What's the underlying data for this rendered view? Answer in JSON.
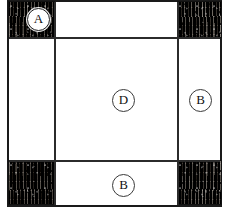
{
  "figure": {
    "type": "technical-cross-section-diagram",
    "background_color": "#ffffff",
    "frame": {
      "border_color": "#1a1a1a",
      "fill_color": "#ffffff"
    },
    "texture_color": "#272320",
    "line_color": "#2b2b2b",
    "regions": [
      {
        "name": "top-left-corner",
        "fill": "dark-textured",
        "label": "A"
      },
      {
        "name": "top-right-corner",
        "fill": "dark-textured",
        "label": ""
      },
      {
        "name": "bottom-left-corner",
        "fill": "dark-textured",
        "label": ""
      },
      {
        "name": "bottom-right-corner",
        "fill": "dark-textured",
        "label": ""
      },
      {
        "name": "top-edge-panel",
        "fill": "white",
        "label": ""
      },
      {
        "name": "left-edge-panel",
        "fill": "white",
        "label": ""
      },
      {
        "name": "right-edge-panel",
        "fill": "white",
        "label": "B"
      },
      {
        "name": "bottom-edge-panel",
        "fill": "white",
        "label": "B"
      },
      {
        "name": "center-panel",
        "fill": "white",
        "label": "D"
      }
    ],
    "callouts": [
      {
        "id": "callout-a",
        "text": "A",
        "region": "top-left-corner",
        "on_dark": true
      },
      {
        "id": "callout-d",
        "text": "D",
        "region": "center-panel",
        "on_dark": false
      },
      {
        "id": "callout-b-right",
        "text": "B",
        "region": "right-edge-panel",
        "on_dark": false
      },
      {
        "id": "callout-b-bottom",
        "text": "B",
        "region": "bottom-edge-panel",
        "on_dark": false
      }
    ]
  }
}
